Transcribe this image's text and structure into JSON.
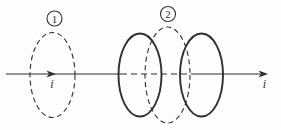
{
  "figure": {
    "type": "physics-diagram",
    "badges": {
      "loop1": "1",
      "loop2": "2"
    },
    "labels": {
      "current_left": "i",
      "current_right": "i"
    },
    "colors": {
      "ink": "#2f2f2f",
      "background": "#fdfdfd"
    }
  }
}
